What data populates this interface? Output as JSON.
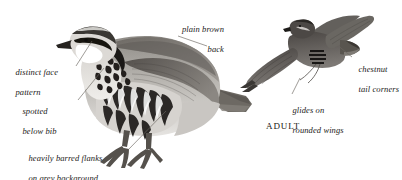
{
  "plate": {
    "species": "red-legged-partridge",
    "background_color": "#ffffff",
    "ink_color": "#1c1a18",
    "leader_line_color": "#6b6660"
  },
  "labels": [
    {
      "id": "plain-brown-back",
      "line1": "plain brown",
      "line2": "back",
      "align": "right",
      "x": 152,
      "y": 14,
      "width": 72
    },
    {
      "id": "distinct-face-pattern",
      "line1": "distinct face",
      "line2": "pattern",
      "align": "left",
      "x": 11,
      "y": 57,
      "width": 70
    },
    {
      "id": "spotted-below-bib",
      "line1": "spotted",
      "line2": "below bib",
      "align": "left",
      "x": 18,
      "y": 96,
      "width": 62
    },
    {
      "id": "heavily-barred-flanks",
      "line1": "heavily barred flanks",
      "line2": "on grey background",
      "align": "left",
      "x": 24,
      "y": 143,
      "width": 108
    },
    {
      "id": "chestnut-tail-corners",
      "line1": "chestnut",
      "line2": "tail corners",
      "align": "left",
      "x": 354,
      "y": 54,
      "width": 48
    },
    {
      "id": "glides-on-rounded-wings",
      "line1": "glides on",
      "line2": "rounded wings",
      "align": "left",
      "x": 288,
      "y": 95,
      "width": 66
    }
  ],
  "caption": {
    "id": "adult-caption",
    "text": "ADULT",
    "x": 266,
    "y": 121
  },
  "leaders": [
    {
      "id": "leader-plain-brown-back",
      "x1": 178,
      "y1": 36,
      "x2": 207,
      "y2": 46
    },
    {
      "id": "leader-distinct-face-pattern",
      "x1": 76,
      "y1": 66,
      "x2": 92,
      "y2": 41
    },
    {
      "id": "leader-spotted-below-bib",
      "x1": 78,
      "y1": 100,
      "x2": 104,
      "y2": 68
    },
    {
      "id": "leader-heavily-barred-flanks",
      "x1": 128,
      "y1": 150,
      "x2": 166,
      "y2": 111
    },
    {
      "id": "leader-chestnut-tail-corners",
      "x1": 352,
      "y1": 57,
      "x2": 336,
      "y2": 44
    },
    {
      "id": "leader-glides-on-rounded-wings",
      "x1": 292,
      "y1": 94,
      "x2": 300,
      "y2": 78
    }
  ]
}
